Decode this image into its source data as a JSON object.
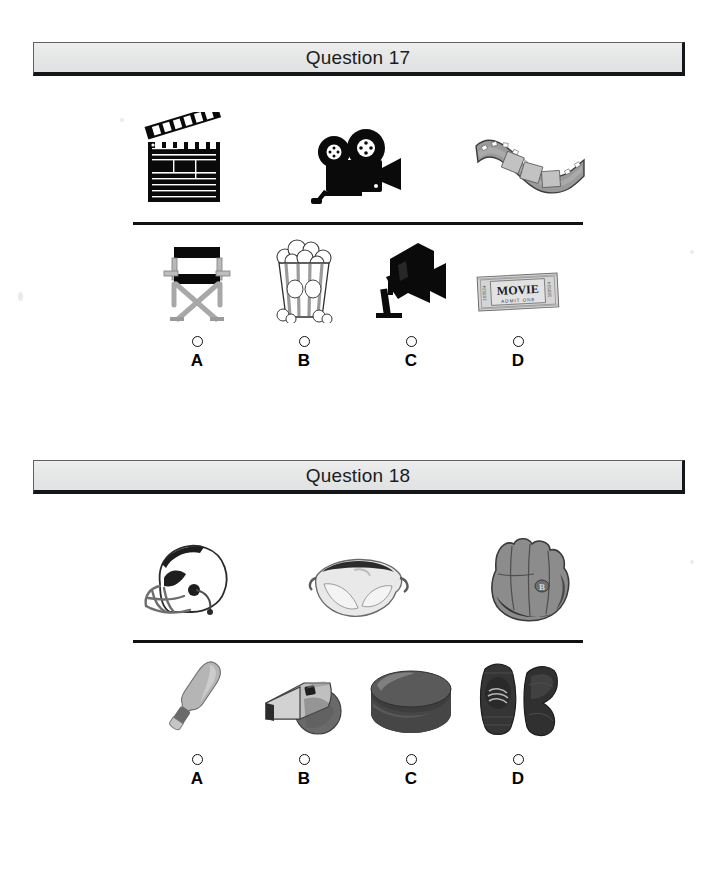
{
  "page": {
    "background_color": "#ffffff",
    "width": 715,
    "height": 888
  },
  "questions": [
    {
      "header": "Question 17",
      "theme": "movies",
      "prompt_items": [
        {
          "name": "clapperboard",
          "label": "clapperboard"
        },
        {
          "name": "movie-camera",
          "label": "movie camera"
        },
        {
          "name": "film-strip",
          "label": "film strip"
        }
      ],
      "options": [
        {
          "letter": "A",
          "name": "directors-chair",
          "label": "director's chair"
        },
        {
          "letter": "B",
          "name": "popcorn-box",
          "label": "popcorn"
        },
        {
          "letter": "C",
          "name": "studio-light",
          "label": "studio light"
        },
        {
          "letter": "D",
          "name": "movie-ticket",
          "label": "movie ticket",
          "ticket_text": "MOVIE",
          "ticket_subtext": "ADMIT ONE"
        }
      ]
    },
    {
      "header": "Question 18",
      "theme": "sports-gear",
      "prompt_items": [
        {
          "name": "football-helmet",
          "label": "football helmet"
        },
        {
          "name": "safety-goggles",
          "label": "safety goggles"
        },
        {
          "name": "baseball-glove",
          "label": "baseball glove"
        }
      ],
      "options": [
        {
          "letter": "A",
          "name": "baseball-bat",
          "label": "baseball bat"
        },
        {
          "letter": "B",
          "name": "whistle",
          "label": "whistle"
        },
        {
          "letter": "C",
          "name": "hockey-puck",
          "label": "hockey puck"
        },
        {
          "letter": "D",
          "name": "knee-pads",
          "label": "knee pads"
        }
      ]
    }
  ],
  "colors": {
    "header_fill": "#e8e9e9",
    "header_border": "#15161a",
    "divider": "#111214",
    "ink": "#000000",
    "gray_mid": "#8b8b8b",
    "gray_dark": "#4a4a4a"
  }
}
